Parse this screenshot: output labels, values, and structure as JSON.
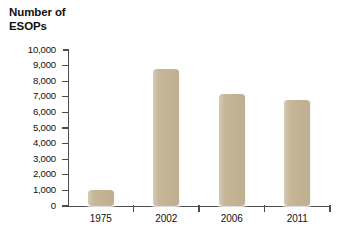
{
  "chart_data": {
    "type": "bar",
    "title": "Number of\nESOPs",
    "xlabel": "",
    "ylabel": "Number of ESOPs",
    "categories": [
      "1975",
      "2002",
      "2006",
      "2011"
    ],
    "values": [
      1000,
      8800,
      7200,
      6800
    ],
    "ylim": [
      0,
      10000
    ],
    "ytick_labels": [
      "10,000",
      "9,000",
      "8,000",
      "7,000",
      "6,000",
      "5,000",
      "4,000",
      "3,000",
      "2,000",
      "1,000",
      "0"
    ],
    "ytick_values": [
      10000,
      9000,
      8000,
      7000,
      6000,
      5000,
      4000,
      3000,
      2000,
      1000,
      0
    ],
    "grid": false,
    "legend": null,
    "bar_color": "#c3b394",
    "axis_color": "#4c4c4c",
    "text_color": "#111111",
    "background": "#ffffff"
  },
  "title_line1": "Number of",
  "title_line2": "ESOPs"
}
